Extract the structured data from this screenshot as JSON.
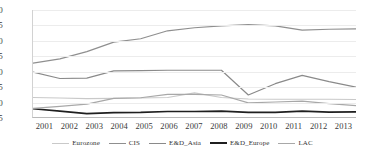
{
  "chart_data": {
    "type": "line",
    "title": "",
    "subtitle": "",
    "xlabel": "",
    "ylabel": "",
    "categories": [
      "2001",
      "2002",
      "2003",
      "2004",
      "2005",
      "2006",
      "2007",
      "2008",
      "2009",
      "2010",
      "2011",
      "2012",
      "2013"
    ],
    "x": [
      2001,
      2002,
      2003,
      2004,
      2005,
      2006,
      2007,
      2008,
      2009,
      2010,
      2011,
      2012,
      2013
    ],
    "ylim": [
      15,
      50
    ],
    "yticks": [
      15,
      20,
      25,
      30,
      35,
      40,
      45,
      50
    ],
    "grid": true,
    "legend_position": "bottom",
    "series": [
      {
        "name": "Eurozone",
        "color": "#c9c9c9",
        "width": 1.1,
        "values": [
          21.4,
          21.2,
          21.0,
          21.1,
          21.2,
          21.4,
          22.9,
          21.4,
          20.9,
          20.8,
          20.8,
          20.8,
          20.7
        ]
      },
      {
        "name": "CIS",
        "color": "#8f8f8f",
        "width": 1.2,
        "values": [
          32.6,
          34.0,
          36.4,
          39.5,
          40.6,
          43.2,
          44.2,
          44.8,
          45.2,
          44.8,
          43.4,
          43.7,
          43.8
        ]
      },
      {
        "name": "E&D_Asia",
        "color": "#8a8a8a",
        "width": 1.2,
        "values": [
          29.7,
          27.6,
          27.7,
          30.1,
          30.2,
          30.3,
          30.3,
          30.3,
          22.2,
          25.9,
          28.6,
          26.6,
          24.8
        ]
      },
      {
        "name": "E&D_Europe",
        "color": "#1f1f1f",
        "width": 1.7,
        "values": [
          17.7,
          16.9,
          16.1,
          16.4,
          16.5,
          16.8,
          16.8,
          16.9,
          16.5,
          16.5,
          16.9,
          16.6,
          16.7
        ]
      },
      {
        "name": "LAC",
        "color": "#a8a8a8",
        "width": 1.2,
        "values": [
          17.8,
          18.5,
          19.2,
          21.1,
          21.3,
          22.4,
          22.4,
          22.2,
          19.6,
          19.9,
          20.2,
          19.4,
          18.7
        ]
      }
    ]
  }
}
